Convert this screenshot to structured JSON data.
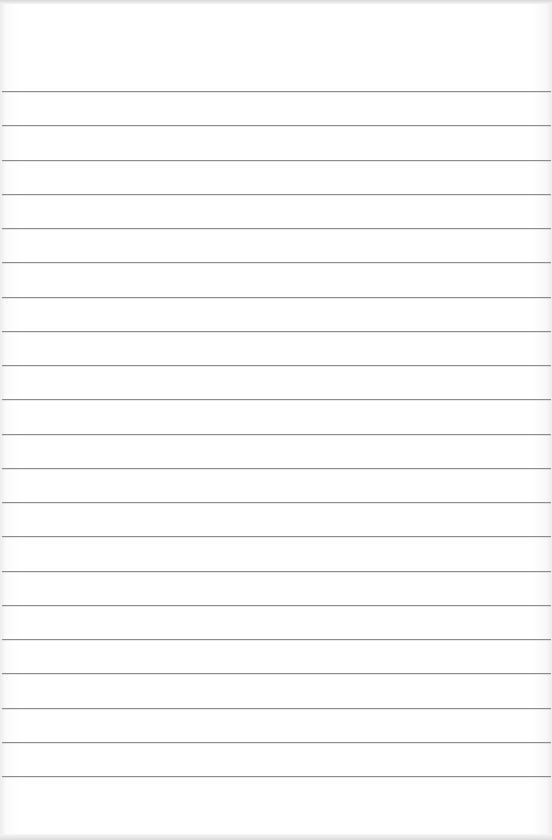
{
  "page": {
    "type": "ruled-paper",
    "background_color": "#ffffff",
    "line_color": "#8c8c8c",
    "line_count": 21,
    "first_line_y": 91,
    "line_spacing": 34.25
  }
}
